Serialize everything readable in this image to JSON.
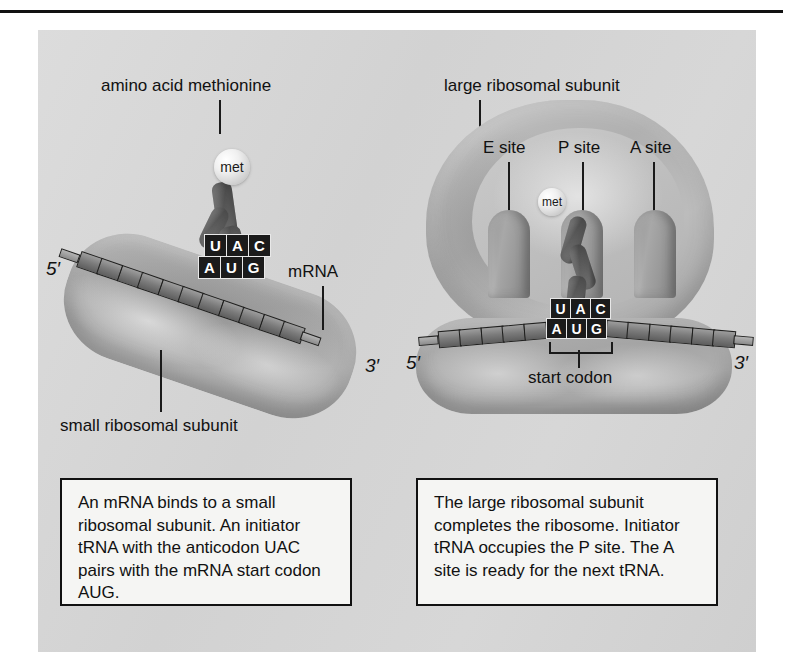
{
  "figure": {
    "panels": [
      {
        "id": "panel-1",
        "labels": {
          "amino_acid": "amino acid methionine",
          "mrna": "mRNA",
          "small_subunit": "small ribosomal subunit",
          "met_sphere": "met",
          "five_prime": "5′",
          "three_prime": "3′"
        },
        "anticodon": [
          "U",
          "A",
          "C"
        ],
        "codon": [
          "A",
          "U",
          "G"
        ],
        "caption": "An mRNA binds to a small ribosomal subunit. An initiator tRNA with the anticodon UAC pairs with the mRNA start codon AUG."
      },
      {
        "id": "panel-2",
        "labels": {
          "large_subunit": "large ribosomal subunit",
          "e_site": "E site",
          "p_site": "P site",
          "a_site": "A site",
          "start_codon": "start codon",
          "met_sphere": "met",
          "five_prime": "5′",
          "three_prime": "3′"
        },
        "anticodon": [
          "U",
          "A",
          "C"
        ],
        "codon": [
          "A",
          "U",
          "G"
        ],
        "caption": "The large ribosomal subunit completes the ribosome. Initiator tRNA occupies the P site. The A site is ready for the next tRNA."
      }
    ],
    "colors": {
      "plate_background": "#d4d4d4",
      "text": "#111111",
      "base_tile_background": "#1b1b1b",
      "base_tile_text": "#ffffff",
      "caption_background": "#f5f5f3",
      "caption_border": "#111111",
      "rule": "#111111"
    }
  }
}
